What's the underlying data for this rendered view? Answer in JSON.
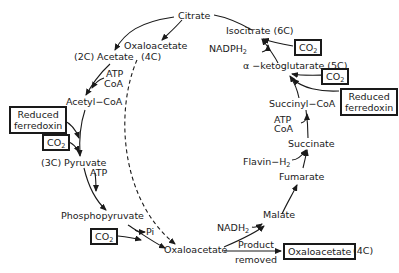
{
  "diagram": {
    "type": "metabolic-cycle",
    "nodes": {
      "citrate": "Citrate",
      "isocitrate": "Isocitrate (6C)",
      "oxaloacetate_top": "Oxaloacetate",
      "oxaloacetate_top_carbons": "(4C)",
      "acetate": "(2C) Acetate",
      "acetyl_coa": "Acetyl−CoA",
      "pyruvate": "(3C) Pyruvate",
      "phosphopyruvate": "Phosphopyruvate",
      "oxaloacetate_bottom": "Oxaloacetate",
      "malate": "Malate",
      "fumarate": "Fumarate",
      "succinate": "Succinate",
      "succinyl_coa": "Succinyl−CoA",
      "alpha_ketoglutarate": "α −ketoglutarate (5C)"
    },
    "cofactors": {
      "nadph2": "NADPH",
      "nadph2_sub": "2",
      "atp_coa_left_1": "ATP",
      "atp_coa_left_2": "CoA",
      "atp_pyruvate": "ATP",
      "pi": "Pi",
      "nadh2": "NADH",
      "nadh2_sub": "2",
      "flavin_h2": "Flavin−H",
      "flavin_h2_sub": "2",
      "atp_coa_right_1": "ATP",
      "atp_coa_right_2": "CoA"
    },
    "boxes": {
      "co2_isocitrate": "CO",
      "co2_akg": "CO",
      "co2_pyruvate": "CO",
      "co2_pep": "CO",
      "co2_sub": "2",
      "reduced_ferredoxin_left_1": "Reduced",
      "reduced_ferredoxin_left_2": "ferredoxin",
      "reduced_ferredoxin_right_1": "Reduced",
      "reduced_ferredoxin_right_2": "ferredoxin",
      "product_oxaloacetate": "Oxaloacetate"
    },
    "annotations": {
      "product_removed_1": "Product",
      "product_removed_2": "removed",
      "product_carbons": "(4C)"
    },
    "colors": {
      "ink": "#1a1a1a",
      "background": "#ffffff"
    }
  }
}
